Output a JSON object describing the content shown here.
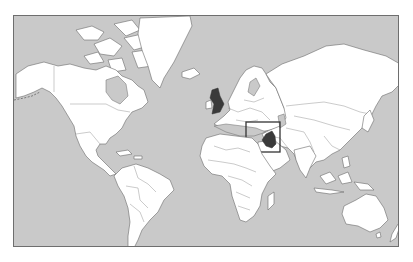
{
  "map": {
    "projection": "mercator",
    "ocean_color": "#c9c9c9",
    "land_color": "#ffffff",
    "border_color": "#6a6a6a",
    "frame_color": "#6e6e6e",
    "highlighted_regions": [
      {
        "name": "United Kingdom",
        "fill": "#3a3a3a"
      },
      {
        "name": "Iraq",
        "fill": "#3a3a3a",
        "boxed": true
      }
    ],
    "locator_box": {
      "target": "Iraq",
      "stroke": "#333333"
    }
  }
}
